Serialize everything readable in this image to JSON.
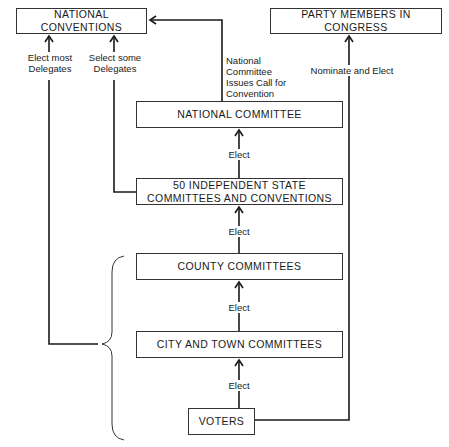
{
  "diagram": {
    "type": "flowchart",
    "nodes": {
      "national_conventions": "NATIONAL CONVENTIONS",
      "party_members_congress": "PARTY MEMBERS IN CONGRESS",
      "national_committee": "NATIONAL COMMITTEE",
      "state_committees_line1": "50 INDEPENDENT STATE",
      "state_committees_line2": "COMMITTEES AND CONVENTIONS",
      "county_committees": "COUNTY COMMITTEES",
      "city_town_committees": "CITY AND TOWN COMMITTEES",
      "voters": "VOTERS"
    },
    "edge_labels": {
      "elect_most_1": "Elect most",
      "elect_most_2": "Delegates",
      "select_some_1": "Select some",
      "select_some_2": "Delegates",
      "call_1": "National",
      "call_2": "Committee",
      "call_3": "Issues Call for",
      "call_4": "Convention",
      "nominate_elect": "Nominate and Elect",
      "elect_state_to_national": "Elect",
      "elect_county_to_state": "Elect",
      "elect_city_to_county": "Elect",
      "elect_voters_to_city": "Elect"
    },
    "edges": [
      {
        "from": "VOTERS",
        "to": "CITY AND TOWN COMMITTEES",
        "label": "Elect"
      },
      {
        "from": "CITY AND TOWN COMMITTEES",
        "to": "COUNTY COMMITTEES",
        "label": "Elect"
      },
      {
        "from": "COUNTY COMMITTEES",
        "to": "50 INDEPENDENT STATE COMMITTEES AND CONVENTIONS",
        "label": "Elect"
      },
      {
        "from": "50 INDEPENDENT STATE COMMITTEES AND CONVENTIONS",
        "to": "NATIONAL COMMITTEE",
        "label": "Elect"
      },
      {
        "from": "50 INDEPENDENT STATE COMMITTEES AND CONVENTIONS",
        "to": "NATIONAL CONVENTIONS",
        "label": "Select some Delegates"
      },
      {
        "from": "LOCAL LEVEL (bracket)",
        "to": "NATIONAL CONVENTIONS",
        "label": "Elect most Delegates"
      },
      {
        "from": "NATIONAL COMMITTEE",
        "to": "NATIONAL CONVENTIONS",
        "label": "National Committee Issues Call for Convention"
      },
      {
        "from": "VOTERS",
        "to": "PARTY MEMBERS IN CONGRESS",
        "label": "Nominate and Elect"
      }
    ]
  }
}
